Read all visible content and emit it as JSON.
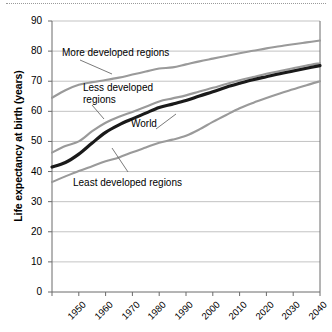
{
  "chart_data": {
    "type": "line",
    "title": "",
    "subtitle": "",
    "xlabel": "",
    "ylabel": "Life expectancy at birth (years)",
    "xlim": [
      1950,
      2050
    ],
    "ylim": [
      0,
      90
    ],
    "ytick_step": 10,
    "grid": true,
    "legend_position": "inline-annotations",
    "x": [
      1950,
      1955,
      1960,
      1965,
      1970,
      1975,
      1980,
      1985,
      1990,
      1995,
      2000,
      2005,
      2010,
      2015,
      2020,
      2025,
      2030,
      2035,
      2040,
      2045,
      2050
    ],
    "xtick_labels": [
      "1950",
      "1960",
      "1970",
      "1980",
      "1990",
      "2000",
      "2010",
      "2020",
      "2030",
      "2040",
      "2050"
    ],
    "ytick_labels": [
      "0",
      "10",
      "20",
      "30",
      "40",
      "50",
      "60",
      "70",
      "80",
      "90"
    ],
    "series": [
      {
        "name": "More developed regions",
        "color": "#9a9a9a",
        "label_x": 1953,
        "label_y": 80,
        "values": [
          64.5,
          67.0,
          68.8,
          69.7,
          70.4,
          71.2,
          72.2,
          73.2,
          74.2,
          74.6,
          75.6,
          76.6,
          77.5,
          78.4,
          79.3,
          80.1,
          80.9,
          81.6,
          82.3,
          82.9,
          83.5
        ]
      },
      {
        "name": "Less developed regions",
        "color": "#9a9a9a",
        "label_x": 1960,
        "label_y": 68,
        "values": [
          46.3,
          48.5,
          50.0,
          53.4,
          56.2,
          58.2,
          59.8,
          61.5,
          63.3,
          64.3,
          65.3,
          66.6,
          67.8,
          69.1,
          70.3,
          71.4,
          72.5,
          73.4,
          74.3,
          75.2,
          76.0
        ]
      },
      {
        "name": "World",
        "color": "#1a1a1a",
        "label_x": 1984,
        "label_y": 59,
        "values": [
          41.5,
          43.0,
          45.8,
          49.5,
          53.0,
          55.5,
          57.5,
          59.4,
          61.3,
          62.4,
          63.6,
          65.1,
          66.5,
          68.0,
          69.3,
          70.5,
          71.5,
          72.5,
          73.4,
          74.3,
          75.2
        ]
      },
      {
        "name": "Least developed regions",
        "color": "#9a9a9a",
        "label_x": 1958,
        "label_y": 35,
        "values": [
          36.5,
          38.4,
          40.2,
          41.8,
          43.4,
          44.7,
          46.4,
          48.0,
          49.6,
          50.6,
          51.9,
          54.0,
          56.5,
          58.8,
          61.0,
          62.8,
          64.4,
          65.9,
          67.3,
          68.7,
          70.0
        ]
      }
    ]
  },
  "axis": {
    "y_title": "Life expectancy at birth (years)"
  },
  "colors": {
    "grey_line": "#9a9a9a",
    "world_line": "#1a1a1a",
    "grid": "#b4b4b4",
    "axis": "#6b6b6b",
    "leader": "#6b6b6b"
  }
}
